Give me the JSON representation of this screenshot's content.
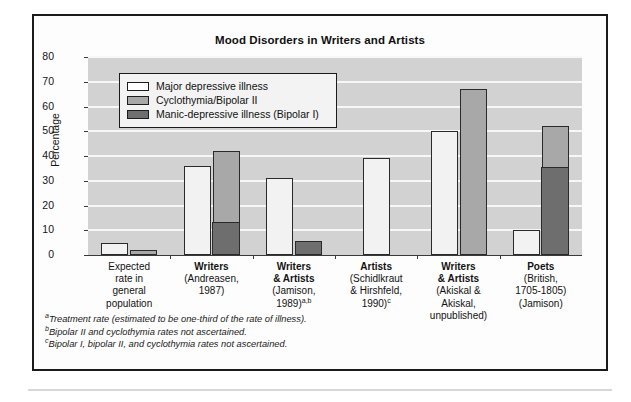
{
  "chart_data": {
    "type": "bar",
    "title": "Mood Disorders in Writers and Artists",
    "xlabel": "",
    "ylabel": "Percentage",
    "ylim": [
      0,
      80
    ],
    "ytick_step": 10,
    "yticks": [
      "80",
      "70",
      "60",
      "50",
      "40",
      "30",
      "20",
      "10",
      "0"
    ],
    "grid": true,
    "legend_position": "upper-left-inside",
    "legend": [
      "Major depressive illness",
      "Cyclothymia/Bipolar II",
      "Manic-depressive illness (Bipolar I)"
    ],
    "categories": [
      "Expected rate in general population",
      "Writers (Andreasen, 1987)",
      "Writers & Artists (Jamison, 1989)",
      "Artists (Schidlkraut & Hirshfeld, 1990)",
      "Writers & Artists (Akiskal & Akiskal, unpublished)",
      "Poets (British, 1705-1805) (Jamison)"
    ],
    "series": [
      {
        "name": "Major depressive illness",
        "values": [
          5,
          36,
          31,
          39,
          50,
          10
        ]
      },
      {
        "name": "Cyclothymia/Bipolar II",
        "values": [
          2,
          42,
          null,
          null,
          67,
          52
        ]
      },
      {
        "name": "Manic-depressive illness (Bipolar I)",
        "values": [
          null,
          13,
          5.5,
          null,
          null,
          35
        ]
      }
    ],
    "colors": {
      "major_depressive": "#f2f2f2",
      "cyclothymia_bipolar2": "#a8a8a8",
      "bipolar1": "#6e6e6e",
      "plot_background": "#d2d2d2",
      "gridline": "#f7f7f7",
      "outline": "#2a2a2a"
    }
  },
  "groups": [
    {
      "head": "Expected",
      "lines": [
        "rate in",
        "general",
        "population"
      ],
      "bold_head": false,
      "bars": [
        {
          "kind": "white",
          "value": 5
        },
        {
          "kind": "gray",
          "value": 2,
          "dark": null
        }
      ]
    },
    {
      "head": "Writers",
      "lines": [
        "(Andreasen,",
        "1987)"
      ],
      "bold_head": true,
      "bars": [
        {
          "kind": "white",
          "value": 36
        },
        {
          "kind": "gray",
          "value": 42,
          "dark": 13
        }
      ]
    },
    {
      "head": "Writers",
      "head2": "& Artists",
      "lines": [
        "(Jamison,",
        "1989)"
      ],
      "sup": "a,b",
      "bold_head": true,
      "bars": [
        {
          "kind": "white",
          "value": 31
        },
        {
          "kind": "dark",
          "value": 5.5
        }
      ]
    },
    {
      "head": "Artists",
      "lines": [
        "(Schidlkraut",
        "& Hirshfeld,",
        "1990)"
      ],
      "sup": "c",
      "bold_head": true,
      "bars": [
        {
          "kind": "white",
          "value": 39
        }
      ]
    },
    {
      "head": "Writers",
      "head2": "& Artists",
      "lines": [
        "(Akiskal &",
        "Akiskal,",
        "unpublished)"
      ],
      "bold_head": true,
      "bars": [
        {
          "kind": "white",
          "value": 50
        },
        {
          "kind": "gray",
          "value": 67,
          "dark": null
        }
      ]
    },
    {
      "head": "Poets",
      "lines": [
        "(British,",
        "1705-1805)",
        "(Jamison)"
      ],
      "bold_head": true,
      "bars": [
        {
          "kind": "white",
          "value": 10
        },
        {
          "kind": "gray",
          "value": 52,
          "dark": 35
        }
      ]
    }
  ],
  "footnotes": [
    {
      "marker": "a",
      "text": "Treatment rate (estimated to be one-third of the rate of illness)."
    },
    {
      "marker": "b",
      "text": "Bipolar II and cyclothymia rates not ascertained."
    },
    {
      "marker": "c",
      "text": "Bipolar I, bipolar II, and cyclothymia rates not ascertained."
    }
  ]
}
